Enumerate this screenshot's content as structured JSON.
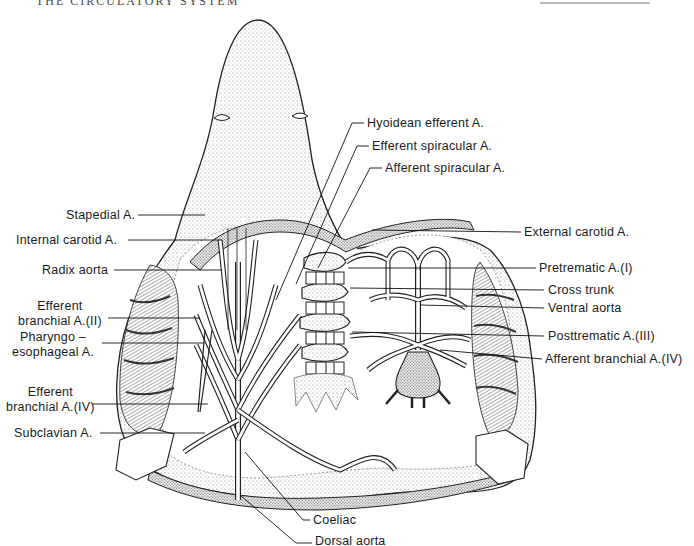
{
  "page": {
    "running_head": "THE CIRCULATORY SYSTEM",
    "figure_subject": "Shark arterial system, ventral view of pharyngeal region"
  },
  "labels_left": [
    {
      "id": "stapedial",
      "text": "Stapedial A."
    },
    {
      "id": "internal-carotid",
      "text": "Internal carotid A."
    },
    {
      "id": "radix-aorta",
      "text": "Radix aorta"
    },
    {
      "id": "efferent-branchial-2",
      "line1": "Efferent",
      "line2": "branchial A.(II)"
    },
    {
      "id": "pharyngo-esophageal",
      "line1": "Pharyngo –",
      "line2": "esophageal A."
    },
    {
      "id": "efferent-branchial-4",
      "line1": "Efferent",
      "line2": "branchial A.(IV)"
    },
    {
      "id": "subclavian",
      "text": "Subclavian A."
    }
  ],
  "labels_top": [
    {
      "id": "hyoidean-efferent",
      "text": "Hyoidean efferent A."
    },
    {
      "id": "efferent-spiracular",
      "text": "Efferent spiracular A."
    },
    {
      "id": "afferent-spiracular",
      "text": "Afferent spiracular A."
    }
  ],
  "labels_right": [
    {
      "id": "external-carotid",
      "text": "External carotid A."
    },
    {
      "id": "pretrematic",
      "text": "Pretrematic A.(I)"
    },
    {
      "id": "cross-trunk",
      "text": "Cross trunk"
    },
    {
      "id": "ventral-aorta",
      "text": "Ventral aorta"
    },
    {
      "id": "posttrematic",
      "text": "Posttrematic A.(III)"
    },
    {
      "id": "afferent-branchial-4",
      "text": "Afferent branchial A.(IV)"
    }
  ],
  "labels_bottom": [
    {
      "id": "coeliac",
      "text": "Coeliac"
    },
    {
      "id": "dorsal-aorta",
      "text": "Dorsal aorta"
    }
  ],
  "colors": {
    "ink": "#1a1a1a",
    "stipple": "#9a9a9a",
    "paper": "#ffffff"
  }
}
